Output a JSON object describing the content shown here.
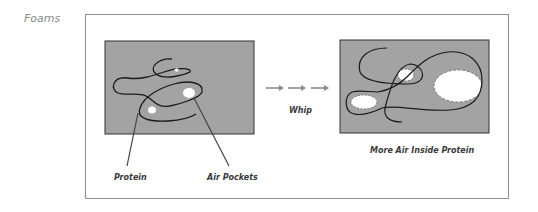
{
  "heading": "Foams",
  "before_panel": {
    "labels": {
      "protein": "Protein",
      "air_pockets": "Air Pockets"
    }
  },
  "process": {
    "label": "Whip",
    "arrow_count": 3
  },
  "after_panel": {
    "caption": "More Air Inside Protein"
  },
  "colors": {
    "panel_fill": "#a3a3a3",
    "panel_border": "#333333",
    "strand": "#1a1a1a",
    "air": "#ffffff",
    "arrow": "#8a8a8a",
    "frame": "#8f8f8f",
    "heading": "#8a8a8a"
  }
}
